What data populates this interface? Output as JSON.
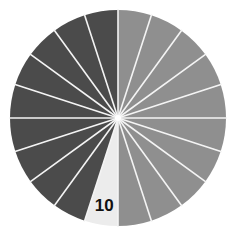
{
  "diagram": {
    "type": "radial-wedge-wheel",
    "center": [
      118,
      118
    ],
    "radius": 108,
    "segment_count": 20,
    "separator_color": "#f4f4f4",
    "colors": {
      "light": "#8f8f8f",
      "dark": "#4b4b4b",
      "highlight": "#ececec"
    },
    "segments": [
      {
        "index": 0,
        "tone": "light"
      },
      {
        "index": 1,
        "tone": "light"
      },
      {
        "index": 2,
        "tone": "light"
      },
      {
        "index": 3,
        "tone": "light"
      },
      {
        "index": 4,
        "tone": "light"
      },
      {
        "index": 5,
        "tone": "light"
      },
      {
        "index": 6,
        "tone": "light"
      },
      {
        "index": 7,
        "tone": "light"
      },
      {
        "index": 8,
        "tone": "light"
      },
      {
        "index": 9,
        "tone": "light"
      },
      {
        "index": 10,
        "tone": "highlight",
        "label": "10"
      },
      {
        "index": 11,
        "tone": "dark"
      },
      {
        "index": 12,
        "tone": "dark"
      },
      {
        "index": 13,
        "tone": "dark"
      },
      {
        "index": 14,
        "tone": "dark"
      },
      {
        "index": 15,
        "tone": "dark"
      },
      {
        "index": 16,
        "tone": "dark"
      },
      {
        "index": 17,
        "tone": "dark"
      },
      {
        "index": 18,
        "tone": "dark"
      },
      {
        "index": 19,
        "tone": "dark"
      }
    ],
    "highlight_label": "10"
  }
}
